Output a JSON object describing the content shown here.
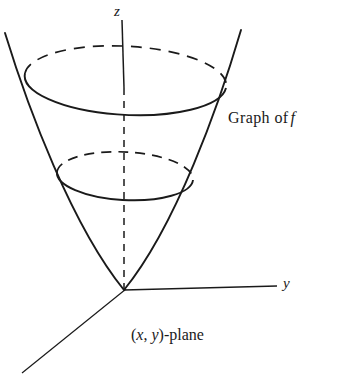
{
  "figure": {
    "type": "math-diagram",
    "background_color": "#ffffff",
    "stroke_color": "#1a1a1a",
    "labels": {
      "z_axis": "z",
      "y_axis": "y",
      "graph_prefix": "Graph of",
      "graph_function": "f",
      "plane_open_paren": "(",
      "plane_x": "x",
      "plane_comma": ", ",
      "plane_y": "y",
      "plane_suffix": ")-plane"
    },
    "geometry": {
      "origin": {
        "x": 124,
        "y": 290
      },
      "z_axis": {
        "top_x": 122,
        "top_y": 20,
        "bottom_x": 124,
        "bottom_y": 290,
        "solid_until_y": 88,
        "dashed_below": true
      },
      "y_axis": {
        "from_x": 124,
        "from_y": 290,
        "to_x": 277,
        "to_y": 286
      },
      "x_axis": {
        "from_x": 124,
        "from_y": 290,
        "to_x": 22,
        "to_y": 373
      },
      "parabola": {
        "vertex_x": 124,
        "vertex_y": 290,
        "left_top_x": 5,
        "left_top_y": 33,
        "right_top_x": 241,
        "right_top_y": 30
      },
      "upper_ellipse": {
        "cx": 125,
        "cy": 80,
        "rx": 100,
        "ry": 34,
        "left_x": 25,
        "right_x": 226
      },
      "lower_ellipse": {
        "cx": 125,
        "cy": 176,
        "rx": 68,
        "ry": 24,
        "left_x": 57,
        "right_x": 193
      }
    }
  }
}
